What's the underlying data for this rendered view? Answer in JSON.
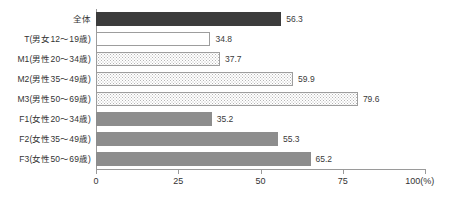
{
  "chart_data": {
    "type": "bar",
    "orientation": "horizontal",
    "title": "",
    "subtitle": "",
    "xlabel": "(%)",
    "ylabel": "",
    "xlim": [
      0,
      100
    ],
    "grid": false,
    "legend": null,
    "categories": [
      "全体",
      "T(男女12～19歳)",
      "M1(男性20～34歳)",
      "M2(男性35～49歳)",
      "M3(男性50～69歳)",
      "F1(女性20～34歳)",
      "F2(女性35～49歳)",
      "F3(女性50～69歳)"
    ],
    "values": [
      56.3,
      34.8,
      37.7,
      59.9,
      79.6,
      35.2,
      55.3,
      65.2
    ],
    "value_labels": [
      "56.3",
      "34.8",
      "37.7",
      "59.9",
      "79.6",
      "35.2",
      "55.3",
      "65.2"
    ],
    "bar_styles": [
      "dark",
      "white",
      "dotted",
      "dotted",
      "dotted",
      "gray",
      "gray",
      "gray"
    ],
    "tick_values": [
      0,
      25,
      50,
      75,
      100
    ],
    "tick_labels": [
      "0",
      "25",
      "50",
      "75",
      "100"
    ],
    "axis_unit_label": "(%)",
    "colors": {
      "bar_dark": "#3c3c3c",
      "bar_white_fill": "#ffffff",
      "bar_white_border": "#9d9d9d",
      "bar_dotted_fill": "#ffffff",
      "bar_dotted_dot": "#b4b4b4",
      "bar_gray": "#8d8d8d",
      "axis": "#9a9a9a",
      "text": "#333333",
      "background": "#ffffff"
    }
  }
}
